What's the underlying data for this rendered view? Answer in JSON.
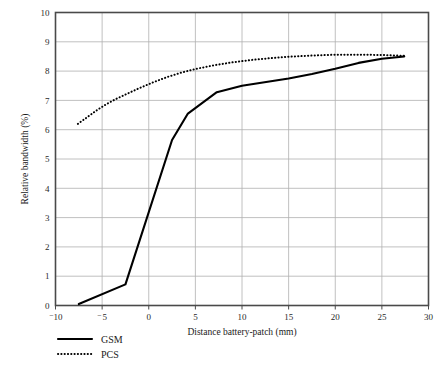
{
  "chart_data": {
    "type": "line",
    "title": "",
    "xlabel": "Distance battery-patch (mm)",
    "ylabel": "Relative bandwidth (%)",
    "xlim": [
      -10,
      30
    ],
    "ylim": [
      0,
      10
    ],
    "xticks": [
      -10,
      -5,
      0,
      5,
      10,
      15,
      20,
      25,
      30
    ],
    "xtick_labels": [
      "⁻10",
      "⁻5",
      "0",
      "5",
      "10",
      "15",
      "20",
      "25",
      "30"
    ],
    "yticks": [
      0,
      1,
      2,
      3,
      4,
      5,
      6,
      7,
      8,
      9,
      10
    ],
    "ytick_labels": [
      "0",
      "1",
      "2",
      "3",
      "4",
      "5",
      "6",
      "7",
      "8",
      "9",
      "10"
    ],
    "grid": true,
    "legend_position": "below-axis-left",
    "series": [
      {
        "name": "GSM",
        "style": "solid",
        "color": "#000000",
        "points": [
          [
            -7.5,
            0.05
          ],
          [
            -2.5,
            0.72
          ],
          [
            2.5,
            5.65
          ],
          [
            4.2,
            6.55
          ],
          [
            7.3,
            7.28
          ],
          [
            10.0,
            7.5
          ],
          [
            15.0,
            7.75
          ],
          [
            17.5,
            7.9
          ],
          [
            20.0,
            8.08
          ],
          [
            22.5,
            8.28
          ],
          [
            25.0,
            8.42
          ],
          [
            27.4,
            8.5
          ]
        ]
      },
      {
        "name": "PCS",
        "style": "dotted",
        "color": "#000000",
        "points": [
          [
            -7.6,
            6.2
          ],
          [
            -6.5,
            6.45
          ],
          [
            -5.5,
            6.68
          ],
          [
            -4.5,
            6.88
          ],
          [
            -3.5,
            7.05
          ],
          [
            -2.5,
            7.2
          ],
          [
            -1.0,
            7.42
          ],
          [
            0.5,
            7.62
          ],
          [
            2.0,
            7.8
          ],
          [
            3.5,
            7.95
          ],
          [
            5.0,
            8.07
          ],
          [
            7.0,
            8.2
          ],
          [
            9.0,
            8.3
          ],
          [
            11.0,
            8.38
          ],
          [
            13.0,
            8.44
          ],
          [
            15.0,
            8.49
          ],
          [
            17.5,
            8.53
          ],
          [
            20.0,
            8.56
          ],
          [
            22.5,
            8.56
          ],
          [
            25.0,
            8.55
          ],
          [
            27.4,
            8.52
          ]
        ]
      }
    ]
  },
  "legend": {
    "items": [
      {
        "label": "GSM",
        "style": "solid"
      },
      {
        "label": "PCS",
        "style": "dotted"
      }
    ]
  },
  "colors": {
    "frame": "#4a4a4a",
    "grid": "#b0b0b0",
    "series": "#000000",
    "background": "#ffffff"
  }
}
